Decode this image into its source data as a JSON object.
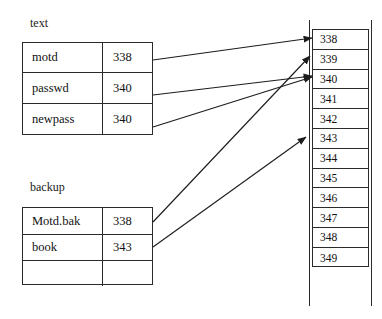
{
  "diagram": {
    "line_color": "#2b2b2b",
    "text_color": "#111111",
    "background": "#ffffff"
  },
  "tables": [
    {
      "label": "text",
      "rows": [
        {
          "name": "motd",
          "block": "338"
        },
        {
          "name": "passwd",
          "block": "340"
        },
        {
          "name": "newpass",
          "block": "340"
        }
      ]
    },
    {
      "label": "backup",
      "rows": [
        {
          "name": "Motd.bak",
          "block": "338"
        },
        {
          "name": "book",
          "block": "343"
        },
        {
          "name": "",
          "block": ""
        }
      ]
    }
  ],
  "block_list": {
    "cells": [
      "338",
      "339",
      "340",
      "341",
      "342",
      "343",
      "344",
      "345",
      "346",
      "347",
      "348",
      "349"
    ]
  },
  "arrows": [
    {
      "from": "text.motd",
      "to": "block.338"
    },
    {
      "from": "text.passwd",
      "to": "block.340"
    },
    {
      "from": "text.newpass",
      "to": "block.340"
    },
    {
      "from": "backup.Motd.bak",
      "to": "block.339"
    },
    {
      "from": "backup.book",
      "to": "block.343"
    }
  ]
}
